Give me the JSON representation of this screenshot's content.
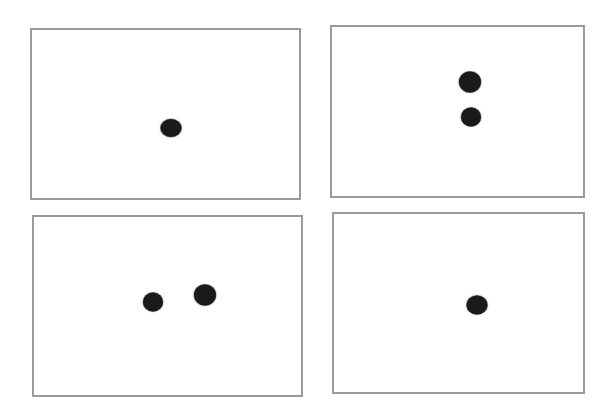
{
  "diagram": {
    "colors": {
      "background": "#ffffff",
      "panel_border": "#9a9a9a",
      "dot": "#1a1a1a"
    },
    "panels": [
      {
        "id": "top-left",
        "box": {
          "x": 30,
          "y": 28,
          "w": 271,
          "h": 172
        },
        "dot_count": 1,
        "dots": [
          {
            "cx": 171,
            "cy": 128,
            "w": 21,
            "h": 18
          }
        ]
      },
      {
        "id": "top-right",
        "box": {
          "x": 330,
          "y": 25,
          "w": 255,
          "h": 173
        },
        "dot_count": 2,
        "dots": [
          {
            "cx": 470,
            "cy": 82,
            "w": 22,
            "h": 21
          },
          {
            "cx": 471,
            "cy": 117,
            "w": 20,
            "h": 19
          }
        ]
      },
      {
        "id": "bottom-left",
        "box": {
          "x": 32,
          "y": 215,
          "w": 271,
          "h": 182
        },
        "dot_count": 2,
        "dots": [
          {
            "cx": 153,
            "cy": 302,
            "w": 20,
            "h": 19
          },
          {
            "cx": 205,
            "cy": 295,
            "w": 22,
            "h": 21
          }
        ]
      },
      {
        "id": "bottom-right",
        "box": {
          "x": 332,
          "y": 212,
          "w": 253,
          "h": 182
        },
        "dot_count": 1,
        "dots": [
          {
            "cx": 477,
            "cy": 305,
            "w": 21,
            "h": 19
          }
        ]
      }
    ]
  }
}
